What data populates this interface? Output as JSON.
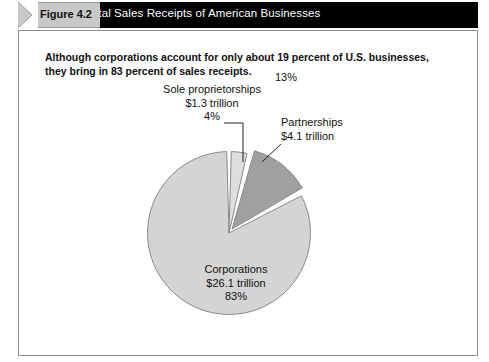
{
  "figure": {
    "tab_label": "Figure 4.2",
    "title": "Total Sales Receipts of American Businesses",
    "subtitle": "Although corporations account for only about 19 percent of U.S. businesses, they bring in 83 percent of sales receipts."
  },
  "colors": {
    "header_bar": "#000000",
    "tab_background": "#c8c8c8",
    "panel_border": "#8d8d8d",
    "corporations_slice": "#d4d4d4",
    "partnerships_slice": "#a0a0a0",
    "sole_proprietorships_slice": "#dedede",
    "slice_outline": "#8a8a8a",
    "leader_line": "#222222"
  },
  "chart_data": {
    "type": "pie",
    "title": "Total Sales Receipts of American Businesses",
    "subtitle": "Although corporations account for only about 19 percent of U.S. businesses, they bring in 83 percent of sales receipts.",
    "unit": "trillions of U.S. dollars",
    "legend_position": "callout-labels",
    "grid": false,
    "categories": [
      "Sole proprietorships",
      "Partnerships",
      "Corporations"
    ],
    "values": [
      1.3,
      4.1,
      26.1
    ],
    "percentages": [
      4,
      13,
      83
    ],
    "slices": [
      {
        "name": "Sole proprietorships",
        "value": 1.3,
        "value_label": "$1.3 trillion",
        "percent": 4,
        "percent_label": "4%",
        "color": "#dedede",
        "exploded": false,
        "start_angle_deg": 0,
        "end_angle_deg": 14.4
      },
      {
        "name": "Partnerships",
        "value": 4.1,
        "value_label": "$4.1 trillion",
        "percent": 13,
        "percent_label": "13%",
        "color": "#a0a0a0",
        "exploded": true,
        "start_angle_deg": 14.4,
        "end_angle_deg": 61.2
      },
      {
        "name": "Corporations",
        "value": 26.1,
        "value_label": "$26.1 trillion",
        "percent": 83,
        "percent_label": "83%",
        "color": "#d4d4d4",
        "exploded": false,
        "start_angle_deg": 61.2,
        "end_angle_deg": 360
      }
    ]
  },
  "labels": {
    "sole": {
      "name": "Sole proprietorships",
      "value": "$1.3 trillion",
      "percent": "4%"
    },
    "partnerships": {
      "name": "Partnerships",
      "value": "$4.1 trillion",
      "percent": "13%"
    },
    "corporations": {
      "name": "Corporations",
      "value": "$26.1 trillion",
      "percent": "83%"
    }
  }
}
